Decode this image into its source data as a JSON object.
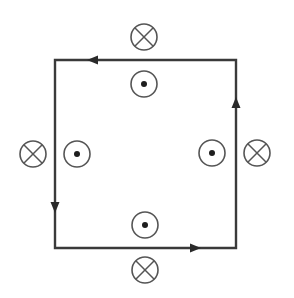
{
  "diagram": {
    "colors": {
      "background": "#ffffff",
      "wire": "#3a3a3a",
      "symbol": "#555555",
      "dot": "#1e1e1e"
    },
    "loop": {
      "corners": {
        "top_left": [
          55,
          60
        ],
        "top_right": [
          236,
          60
        ],
        "bottom_right": [
          236,
          248
        ],
        "bottom_left": [
          55,
          248
        ]
      },
      "current_direction": "counterclockwise",
      "arrows": [
        {
          "edge": "top",
          "position": [
            93,
            60
          ],
          "direction": "left"
        },
        {
          "edge": "right",
          "position": [
            236,
            103
          ],
          "direction": "up"
        },
        {
          "edge": "left",
          "position": [
            55,
            207
          ],
          "direction": "down"
        },
        {
          "edge": "bottom",
          "position": [
            195,
            248
          ],
          "direction": "right"
        }
      ]
    },
    "field_symbols": [
      {
        "name": "top-outside",
        "type": "into-page",
        "glyph": "⊗",
        "center": [
          144,
          37
        ],
        "radius": 13
      },
      {
        "name": "top-inside",
        "type": "out-of-page",
        "glyph": "⊙",
        "center": [
          144,
          84
        ],
        "radius": 13
      },
      {
        "name": "left-outside",
        "type": "into-page",
        "glyph": "⊗",
        "center": [
          33,
          154
        ],
        "radius": 13
      },
      {
        "name": "left-inside",
        "type": "out-of-page",
        "glyph": "⊙",
        "center": [
          77,
          154
        ],
        "radius": 13
      },
      {
        "name": "right-inside",
        "type": "out-of-page",
        "glyph": "⊙",
        "center": [
          212,
          153
        ],
        "radius": 13
      },
      {
        "name": "right-outside",
        "type": "into-page",
        "glyph": "⊗",
        "center": [
          257,
          153
        ],
        "radius": 13
      },
      {
        "name": "bottom-inside",
        "type": "out-of-page",
        "glyph": "⊙",
        "center": [
          145,
          225
        ],
        "radius": 13
      },
      {
        "name": "bottom-outside",
        "type": "into-page",
        "glyph": "⊗",
        "center": [
          145,
          270
        ],
        "radius": 13
      }
    ]
  }
}
